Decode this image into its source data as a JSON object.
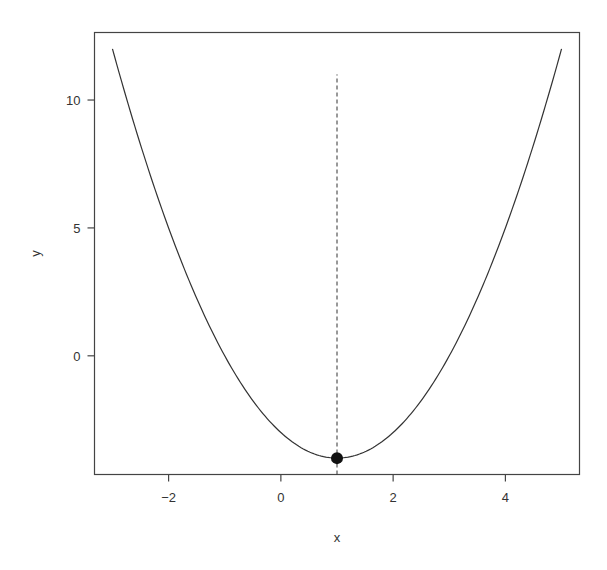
{
  "chart_data": {
    "type": "line",
    "title": "",
    "xlabel": "x",
    "ylabel": "y",
    "xlim": [
      -3.32,
      5.32
    ],
    "ylim": [
      -4.64,
      12.64
    ],
    "grid": false,
    "legend": null,
    "x_ticks": [
      -2,
      0,
      2,
      4
    ],
    "y_ticks": [
      0,
      5,
      10
    ],
    "x_tick_labels": [
      "−2",
      "0",
      "2",
      "4"
    ],
    "y_tick_labels": [
      "0",
      "5",
      "10"
    ],
    "series": [
      {
        "name": "curve",
        "function": "y = (x - 1)^2 - 4",
        "style": "solid",
        "color": "#333333",
        "x": [
          -3,
          -2.5,
          -2,
          -1.5,
          -1,
          -0.5,
          0,
          0.5,
          1,
          1.5,
          2,
          2.5,
          3,
          3.5,
          4,
          4.5,
          5
        ],
        "y": [
          12,
          8.25,
          5,
          2.25,
          0,
          -1.75,
          -3,
          -3.75,
          -4,
          -3.75,
          -3,
          -1.75,
          0,
          2.25,
          5,
          8.25,
          12
        ]
      }
    ],
    "annotations": [
      {
        "type": "point",
        "x": 1,
        "y": -4,
        "label": "minimum",
        "color": "#111111"
      },
      {
        "type": "vline",
        "x": 1,
        "y_from": -4.64,
        "y_to": 11,
        "style": "dashed",
        "color": "#333333"
      }
    ]
  }
}
